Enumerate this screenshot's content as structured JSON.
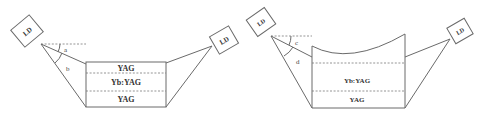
{
  "diagram_left": {
    "laser_left_label": "LD",
    "laser_right_label": "LD",
    "angle_labels": [
      "a",
      "b"
    ],
    "layers": [
      "YAG",
      "Yb:YAG",
      "YAG"
    ]
  },
  "diagram_right": {
    "laser_left_label": "LD",
    "laser_right_label": "LD",
    "angle_labels": [
      "c",
      "d"
    ],
    "layers": [
      "Yb:YAG",
      "YAG"
    ]
  },
  "colors": {
    "line": "#6a6a6a",
    "text": "#333333",
    "background": "#ffffff"
  }
}
